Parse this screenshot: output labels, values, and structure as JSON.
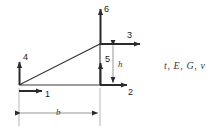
{
  "figure": {
    "name": "plane-stress-triangle-element-dof-diagram",
    "background_color": "#ffffff",
    "line_color": "#2b2b2b",
    "dim_line_color": "#8a8a8a",
    "label_color": "#1a1a1a"
  },
  "geometry": {
    "vertices": {
      "bottom_left": {
        "x": 19,
        "y": 85
      },
      "bottom_right": {
        "x": 100,
        "y": 85
      },
      "top_right": {
        "x": 100,
        "y": 44
      }
    },
    "width_px": 81,
    "height_px": 41
  },
  "dof_arrows": [
    {
      "id": "1",
      "label": "1",
      "direction": "right",
      "at_node": "bottom-left",
      "label_x": 45,
      "label_y": 90
    },
    {
      "id": "2",
      "label": "2",
      "direction": "right",
      "at_node": "bottom-right",
      "label_x": 128,
      "label_y": 88
    },
    {
      "id": "3",
      "label": "3",
      "direction": "right",
      "at_node": "top-right",
      "label_x": 127,
      "label_y": 31
    },
    {
      "id": "4",
      "label": "4",
      "direction": "up",
      "at_node": "bottom-left",
      "label_x": 23,
      "label_y": 53
    },
    {
      "id": "5",
      "label": "5",
      "direction": "up",
      "at_node": "bottom-right",
      "label_x": 105,
      "label_y": 55
    },
    {
      "id": "6",
      "label": "6",
      "direction": "up",
      "at_node": "top-right",
      "label_x": 104,
      "label_y": 5
    }
  ],
  "dimensions": [
    {
      "id": "b",
      "label": "b",
      "orientation": "horizontal",
      "label_x": 56,
      "label_y": 108
    },
    {
      "id": "h",
      "label": "h",
      "orientation": "vertical",
      "label_x": 118,
      "label_y": 60
    }
  ],
  "annotations": {
    "material_properties": "t, E, G, ν",
    "material_properties_x": 164,
    "material_properties_y": 61
  }
}
